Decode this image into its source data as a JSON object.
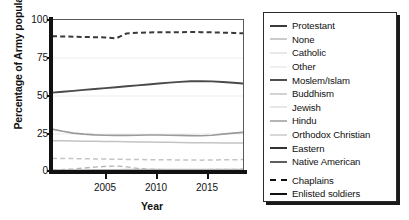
{
  "chart_data": {
    "type": "line",
    "title": "",
    "xlabel": "Year",
    "ylabel": "Percentage of Army population",
    "xlim": [
      2001,
      2019
    ],
    "ylim": [
      0,
      100
    ],
    "grid": true,
    "legend_position": "right-outside",
    "yticks": [
      0,
      25,
      50,
      75,
      100
    ],
    "xticks": [
      2005,
      2010,
      2015
    ],
    "x": [
      2001,
      2002,
      2003,
      2004,
      2005,
      2006,
      2007,
      2008,
      2009,
      2010,
      2011,
      2012,
      2013,
      2014,
      2015,
      2016,
      2017,
      2018,
      2019
    ],
    "series": [
      {
        "name": "Protestant",
        "group": "Chaplains",
        "style": "dashed",
        "color": "#3a3a3a",
        "width": 2.0,
        "values": [
          89.3,
          89.2,
          89.0,
          88.8,
          88.7,
          88.5,
          87.9,
          91.2,
          91.6,
          91.8,
          91.9,
          92.0,
          92.0,
          92.1,
          92.0,
          91.9,
          91.7,
          91.5,
          91.2
        ]
      },
      {
        "name": "Protestant",
        "group": "Enlisted soldiers",
        "style": "solid",
        "color": "#4a4a4a",
        "width": 1.9,
        "values": [
          52.2,
          52.8,
          53.4,
          54.0,
          54.6,
          55.2,
          55.8,
          56.4,
          57.0,
          57.6,
          58.2,
          58.8,
          59.3,
          59.7,
          59.8,
          59.6,
          59.2,
          58.7,
          58.2
        ]
      },
      {
        "name": "None",
        "group": "Enlisted soldiers",
        "style": "solid",
        "color": "#9a9a9a",
        "width": 1.6,
        "values": [
          28.2,
          26.8,
          25.6,
          24.9,
          24.4,
          24.2,
          24.1,
          24.1,
          24.2,
          24.3,
          24.3,
          24.2,
          24.1,
          23.9,
          23.8,
          24.2,
          24.9,
          25.6,
          26.1
        ]
      },
      {
        "name": "Catholic",
        "group": "Enlisted soldiers",
        "style": "solid",
        "color": "#c4c4c4",
        "width": 1.5,
        "values": [
          20.6,
          20.5,
          20.4,
          20.3,
          20.2,
          20.1,
          20.0,
          19.9,
          19.8,
          19.7,
          19.6,
          19.5,
          19.4,
          19.3,
          19.2,
          19.2,
          19.1,
          19.1,
          19.0
        ]
      },
      {
        "name": "Catholic",
        "group": "Chaplains",
        "style": "dashed",
        "color": "#c4c4c4",
        "width": 1.5,
        "values": [
          9.0,
          8.9,
          8.8,
          8.7,
          8.6,
          8.5,
          8.4,
          8.3,
          8.2,
          8.1,
          8.0,
          8.0,
          7.9,
          7.9,
          7.8,
          7.9,
          8.0,
          8.1,
          8.2
        ]
      },
      {
        "name": "Other",
        "group": "Chaplains",
        "style": "dashed",
        "color": "#b5b5b5",
        "width": 1.4,
        "values": [
          1.4,
          1.6,
          2.0,
          2.6,
          3.2,
          3.7,
          3.9,
          3.4,
          2.4,
          1.8,
          1.6,
          1.5,
          1.5,
          1.5,
          1.5,
          1.6,
          1.7,
          1.7,
          1.8
        ]
      },
      {
        "name": "Other",
        "group": "Enlisted soldiers",
        "style": "solid",
        "color": "#b5b5b5",
        "width": 1.4,
        "values": [
          1.3,
          1.3,
          1.4,
          1.4,
          1.5,
          1.5,
          1.5,
          1.6,
          1.6,
          1.6,
          1.6,
          1.6,
          1.6,
          1.6,
          1.6,
          1.6,
          1.6,
          1.6,
          1.6
        ]
      },
      {
        "name": "Moslem/Islam",
        "group": "Enlisted soldiers",
        "style": "solid",
        "color": "#5a5a5a",
        "width": 1.4,
        "values": [
          0.4,
          0.4,
          0.4,
          0.4,
          0.4,
          0.4,
          0.4,
          0.4,
          0.4,
          0.4,
          0.4,
          0.4,
          0.4,
          0.4,
          0.4,
          0.4,
          0.4,
          0.4,
          0.4
        ]
      },
      {
        "name": "Buddhism",
        "group": "Enlisted soldiers",
        "style": "solid",
        "color": "#a0a0a0",
        "width": 1.4,
        "values": [
          0.3,
          0.3,
          0.3,
          0.3,
          0.3,
          0.3,
          0.3,
          0.3,
          0.3,
          0.3,
          0.3,
          0.3,
          0.3,
          0.3,
          0.3,
          0.3,
          0.3,
          0.3,
          0.3
        ]
      },
      {
        "name": "Jewish",
        "group": "Enlisted soldiers",
        "style": "solid",
        "color": "#c9c9c9",
        "width": 1.4,
        "values": [
          0.3,
          0.3,
          0.3,
          0.3,
          0.3,
          0.3,
          0.3,
          0.3,
          0.3,
          0.3,
          0.3,
          0.3,
          0.3,
          0.3,
          0.3,
          0.3,
          0.3,
          0.3,
          0.3
        ]
      },
      {
        "name": "Hindu",
        "group": "Enlisted soldiers",
        "style": "solid",
        "color": "#808080",
        "width": 1.4,
        "values": [
          0.2,
          0.2,
          0.2,
          0.2,
          0.2,
          0.2,
          0.2,
          0.2,
          0.2,
          0.2,
          0.2,
          0.2,
          0.2,
          0.2,
          0.2,
          0.2,
          0.2,
          0.2,
          0.2
        ]
      },
      {
        "name": "Orthodox Christian",
        "group": "Enlisted soldiers",
        "style": "solid",
        "color": "#aeaeae",
        "width": 1.4,
        "values": [
          0.2,
          0.2,
          0.2,
          0.2,
          0.2,
          0.2,
          0.2,
          0.2,
          0.2,
          0.2,
          0.2,
          0.2,
          0.2,
          0.2,
          0.2,
          0.2,
          0.2,
          0.2,
          0.2
        ]
      },
      {
        "name": "Eastern",
        "group": "Enlisted soldiers",
        "style": "solid",
        "color": "#3f3f3f",
        "width": 1.4,
        "values": [
          0.15,
          0.15,
          0.15,
          0.15,
          0.15,
          0.15,
          0.15,
          0.15,
          0.15,
          0.15,
          0.15,
          0.15,
          0.15,
          0.15,
          0.15,
          0.15,
          0.15,
          0.15,
          0.15
        ]
      },
      {
        "name": "Native American",
        "group": "Enlisted soldiers",
        "style": "solid",
        "color": "#6e6e6e",
        "width": 1.4,
        "values": [
          0.1,
          0.1,
          0.1,
          0.1,
          0.1,
          0.1,
          0.1,
          0.1,
          0.1,
          0.1,
          0.1,
          0.1,
          0.1,
          0.1,
          0.1,
          0.1,
          0.1,
          0.1,
          0.1
        ]
      }
    ]
  },
  "axes": {
    "ylabel": "Percentage of Army population",
    "xlabel": "Year",
    "ytick_labels": [
      "100",
      "75",
      "50",
      "25",
      "0"
    ],
    "xtick_labels": [
      "2005",
      "2010",
      "2015"
    ]
  },
  "legend": {
    "religions": [
      {
        "label": "Protestant",
        "color": "#3a3a3a",
        "width": 2.0,
        "style": "solid"
      },
      {
        "label": "None",
        "color": "#9a9a9a",
        "width": 1.8,
        "style": "solid"
      },
      {
        "label": "Catholic",
        "color": "#d2d2d2",
        "width": 1.6,
        "style": "solid"
      },
      {
        "label": "Other",
        "color": "#e0e0e0",
        "width": 1.6,
        "style": "solid"
      },
      {
        "label": "Moslem/Islam",
        "color": "#4f4f4f",
        "width": 2.0,
        "style": "solid"
      },
      {
        "label": "Buddhism",
        "color": "#a8a8a8",
        "width": 1.8,
        "style": "solid"
      },
      {
        "label": "Jewish",
        "color": "#cfcfcf",
        "width": 1.6,
        "style": "solid"
      },
      {
        "label": "Hindu",
        "color": "#6b6b6b",
        "width": 1.8,
        "style": "solid"
      },
      {
        "label": "Orthodox Christian",
        "color": "#b0b0b0",
        "width": 1.6,
        "style": "solid"
      },
      {
        "label": "Eastern",
        "color": "#333333",
        "width": 2.0,
        "style": "solid"
      },
      {
        "label": "Native American",
        "color": "#5e5e5e",
        "width": 2.0,
        "style": "solid"
      }
    ],
    "groups": [
      {
        "label": "Chaplains",
        "color": "#111111",
        "width": 2.4,
        "style": "dashed"
      },
      {
        "label": "Enlisted soldiers",
        "color": "#111111",
        "width": 2.6,
        "style": "solid"
      }
    ]
  }
}
